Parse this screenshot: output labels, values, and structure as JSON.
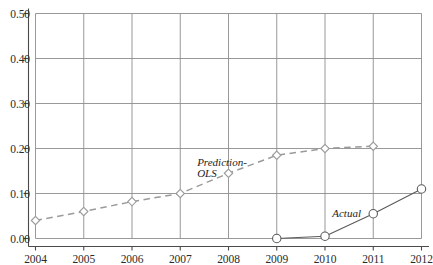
{
  "chart_data": {
    "type": "line",
    "title": "",
    "xlabel": "",
    "ylabel": "",
    "categories": [
      2004,
      2005,
      2006,
      2007,
      2008,
      2009,
      2010,
      2011,
      2012
    ],
    "xtick_labels": [
      "2004",
      "2005",
      "2006",
      "2007",
      "2008",
      "2009",
      "2010",
      "2011",
      "2012"
    ],
    "ytick_labels": [
      "0.00",
      "0.10",
      "0.20",
      "0.30",
      "0.40",
      "0.50"
    ],
    "ytick_values": [
      0.0,
      0.1,
      0.2,
      0.3,
      0.4,
      0.5
    ],
    "xlim": [
      2004,
      2012
    ],
    "ylim": [
      0.0,
      0.5
    ],
    "grid": true,
    "legend_position": "inline-annotation",
    "series": [
      {
        "name": "Prediction-OLS",
        "label": "Prediction-\nOLS",
        "style": "dashed",
        "marker": "diamond",
        "color": "#9a9a9a",
        "x": [
          2004,
          2005,
          2006,
          2007,
          2008,
          2009,
          2010,
          2011
        ],
        "values": [
          0.04,
          0.06,
          0.082,
          0.1,
          0.145,
          0.185,
          0.2,
          0.205
        ]
      },
      {
        "name": "Actual",
        "label": "Actual",
        "style": "solid",
        "marker": "circle",
        "color": "#5a5a5a",
        "x": [
          2009,
          2010,
          2011,
          2012
        ],
        "values": [
          0.0,
          0.005,
          0.055,
          0.11
        ]
      }
    ],
    "annotations": [
      {
        "text": "Prediction-\nOLS",
        "series": "Prediction-OLS",
        "x": 2007.35,
        "y": 0.182
      },
      {
        "text": "Actual",
        "series": "Actual",
        "x": 2010.15,
        "y": 0.068
      }
    ],
    "colors": {
      "grid": "#8d8d8d",
      "axis": "#4a4a4a",
      "prediction": "#9a9a9a",
      "actual": "#5a5a5a",
      "text": "#2b2b2b",
      "background": "#ffffff"
    }
  }
}
